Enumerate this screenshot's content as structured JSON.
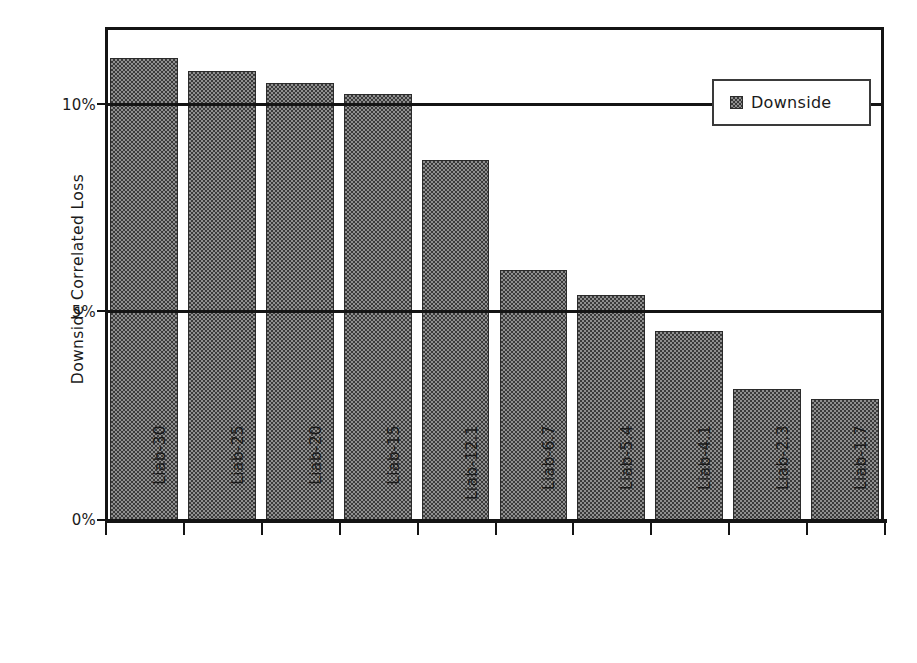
{
  "chart_data": {
    "type": "bar",
    "title": "",
    "xlabel": "",
    "ylabel": "Downside Correlated Loss",
    "categories": [
      "Liab-30",
      "Liab-25",
      "Liab-20",
      "Liab-15",
      "Liab-12.1",
      "Liab-6.7",
      "Liab-5.4",
      "Liab-4.1",
      "Liab-2.3",
      "Liab-1.7"
    ],
    "series": [
      {
        "name": "Downside",
        "values": [
          11.1,
          10.8,
          10.5,
          10.25,
          8.65,
          6.0,
          5.4,
          4.55,
          3.15,
          2.9
        ]
      }
    ],
    "ylim": [
      0,
      11.85
    ],
    "ytick_values": [
      0,
      5,
      10
    ],
    "ytick_labels": [
      "0%",
      "5%",
      "10%"
    ],
    "grid": true,
    "legend_position": "top-right",
    "legend_entries": [
      {
        "label": "Downside",
        "swatch": "dithered-gray-square"
      }
    ],
    "bar_fill_color": "#8f8f8f",
    "bar_edge_color": "#2b2b2b",
    "axis_color": "#141414"
  },
  "axis": {
    "y_title": "Downside Correlated Loss"
  },
  "legend": {
    "entry_label": "Downside"
  }
}
